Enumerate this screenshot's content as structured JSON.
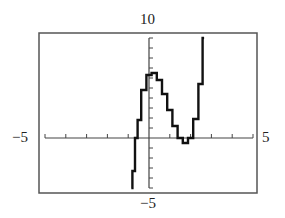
{
  "window": {
    "ymax_label": "10",
    "ymin_label": "−5",
    "xmin_label": "−5",
    "xmax_label": "5"
  },
  "colors": {
    "background": "#ffffff",
    "frame": "#555555",
    "axis": "#444444",
    "curve": "#111111"
  },
  "chart_data": {
    "type": "line",
    "title": "",
    "xlabel": "",
    "ylabel": "",
    "xlim": [
      -5,
      5
    ],
    "ylim": [
      -5,
      10
    ],
    "xticks_step": 1,
    "yticks_step": 1,
    "grid": false,
    "legend": null,
    "annotations": [
      "10",
      "−5",
      "−5",
      "5"
    ],
    "series": [
      {
        "name": "f(x)",
        "style": "stepped calculator trace",
        "x": [
          -0.85,
          -0.75,
          -0.6,
          -0.5,
          -0.25,
          0,
          0.25,
          0.5,
          0.75,
          1.0,
          1.25,
          1.5,
          1.75,
          2.0,
          2.25,
          2.5,
          2.65
        ],
        "y": [
          -5,
          -3.3,
          0,
          1.8,
          4.8,
          6.3,
          6.5,
          5.8,
          4.4,
          2.8,
          1.2,
          0,
          -0.5,
          0,
          1.9,
          5.4,
          10
        ]
      }
    ]
  }
}
